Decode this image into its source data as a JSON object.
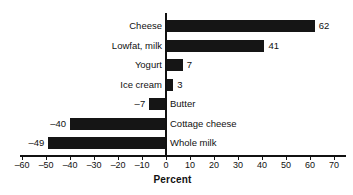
{
  "chart_data": {
    "type": "bar",
    "orientation": "horizontal",
    "title": "",
    "xlabel": "Percent",
    "ylabel": "",
    "xlim": [
      -60,
      70
    ],
    "xticks": [
      -60,
      -50,
      -40,
      -30,
      -20,
      -10,
      0,
      10,
      20,
      30,
      40,
      50,
      60,
      70
    ],
    "xtick_labels": [
      "–60",
      "–50",
      "–40",
      "–30",
      "–20",
      "–10",
      "0",
      "10",
      "20",
      "30",
      "40",
      "50",
      "60",
      "70"
    ],
    "grid": false,
    "legend": null,
    "bar_color": "#151515",
    "categories": [
      "Cheese",
      "Lowfat, milk",
      "Yogurt",
      "Ice cream",
      "Butter",
      "Cottage cheese",
      "Whole milk"
    ],
    "values": [
      62,
      41,
      7,
      3,
      -7,
      -40,
      -49
    ],
    "value_labels": [
      "62",
      "41",
      "7",
      "3",
      "–7",
      "–40",
      "–49"
    ]
  }
}
